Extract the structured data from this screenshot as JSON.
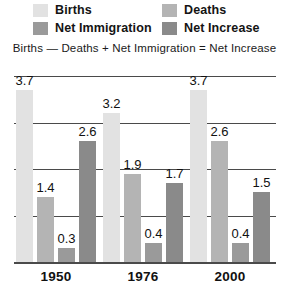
{
  "legend": {
    "items": [
      {
        "label": "Births",
        "color": "#e2e2e2",
        "swatch_name": "births-swatch"
      },
      {
        "label": "Deaths",
        "color": "#b4b4b4",
        "swatch_name": "deaths-swatch"
      },
      {
        "label": "Net Immigration",
        "color": "#9a9a9a",
        "swatch_name": "net-immigration-swatch"
      },
      {
        "label": "Net Increase",
        "color": "#8a8a8a",
        "swatch_name": "net-increase-swatch"
      }
    ]
  },
  "formula": "Births — Deaths + Net Immigration = Net Increase",
  "chart_data": {
    "type": "bar",
    "title": "",
    "xlabel": "",
    "ylabel": "",
    "ylim": [
      0,
      4.0
    ],
    "grid": true,
    "gridlines": [
      1.0,
      2.0,
      3.0,
      4.0
    ],
    "legend_position": "top",
    "categories": [
      "1950",
      "1976",
      "2000"
    ],
    "series": [
      {
        "name": "Births",
        "color": "#e2e2e2",
        "values": [
          3.7,
          3.2,
          3.7
        ]
      },
      {
        "name": "Deaths",
        "color": "#b4b4b4",
        "values": [
          1.4,
          1.9,
          2.6
        ]
      },
      {
        "name": "Net Immigration",
        "color": "#9a9a9a",
        "values": [
          0.3,
          0.4,
          0.4
        ]
      },
      {
        "name": "Net Increase",
        "color": "#8a8a8a",
        "values": [
          2.6,
          1.7,
          1.5
        ]
      }
    ],
    "bar_labels": [
      [
        "3.7",
        "1.4",
        "0.3",
        "2.6"
      ],
      [
        "3.2",
        "1.9",
        "0.4",
        "1.7"
      ],
      [
        "3.7",
        "2.6",
        "0.4",
        "1.5"
      ]
    ]
  }
}
